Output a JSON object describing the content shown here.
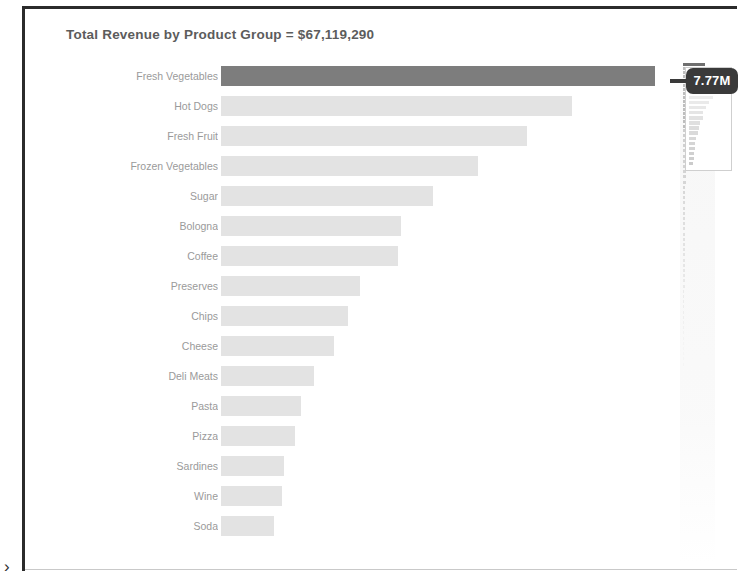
{
  "chart_title": "Total Revenue by Product Group = $67,119,290",
  "pan_chevron": "›",
  "tooltip": {
    "value_label": "7.77M",
    "background": "#3a3a3a",
    "text_color": "#ffffff"
  },
  "colors": {
    "bar_default": "#e3e3e3",
    "bar_highlight": "#7d7d7d",
    "label_text": "#9a9a9a",
    "title_text": "#5c5c5c",
    "frame_border": "#2b2b2b",
    "background": "#ffffff"
  },
  "minimap": {
    "popup_title": "Total Revenue by",
    "popup_subtitle": "Product Group"
  },
  "chart_data": {
    "type": "bar",
    "orientation": "horizontal",
    "title": "Total Revenue by Product Group = $67,119,290",
    "xlabel": "",
    "ylabel": "",
    "grid": false,
    "legend": false,
    "total_label": "$67,119,290",
    "total_value": 67119290,
    "value_unit": "USD",
    "highlighted_category": "Fresh Vegetables",
    "highlighted_value_label": "7.77M",
    "xlim": [
      0,
      7770000
    ],
    "categories": [
      "Fresh Vegetables",
      "Hot Dogs",
      "Fresh Fruit",
      "Frozen Vegetables",
      "Sugar",
      "Bologna",
      "Coffee",
      "Preserves",
      "Chips",
      "Cheese",
      "Deli Meats",
      "Pasta",
      "Pizza",
      "Sardines",
      "Wine",
      "Soda"
    ],
    "values": [
      7770000,
      6290000,
      5480000,
      4610000,
      3790000,
      3230000,
      3170000,
      2490000,
      2270000,
      2020000,
      1660000,
      1440000,
      1330000,
      1120000,
      1090000,
      940000
    ]
  }
}
